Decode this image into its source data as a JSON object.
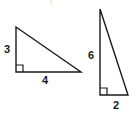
{
  "figure": {
    "kind": "geometry-diagram",
    "background_color": "#ffffff",
    "stroke_color": "#1a1a1a",
    "label_color": "#1a1a1a",
    "top_artifact": "|",
    "shapes": [
      {
        "name": "left-triangle",
        "type": "right-triangle",
        "right_angle_at": "bottom-left",
        "vertices": {
          "apex": [
            16,
            27
          ],
          "right_angle": [
            16,
            72
          ],
          "far": [
            81,
            72
          ]
        },
        "right_angle_marker_size": 7,
        "labels": {
          "vertical_leg": "3",
          "horizontal_leg": "4"
        }
      },
      {
        "name": "right-triangle",
        "type": "right-triangle",
        "right_angle_at": "bottom-left",
        "vertices": {
          "apex": [
            100,
            9
          ],
          "right_angle": [
            100,
            95
          ],
          "far": [
            128,
            95
          ]
        },
        "right_angle_marker_size": 7,
        "labels": {
          "vertical_leg": "6",
          "horizontal_leg": "2"
        }
      }
    ],
    "labels": {
      "left_vertical": "3",
      "left_base": "4",
      "right_vertical": "6",
      "right_base": "2"
    }
  }
}
